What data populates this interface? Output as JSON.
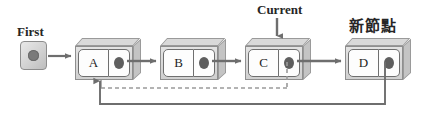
{
  "diagram": {
    "labels": {
      "first": "First",
      "current": "Current",
      "new_node": "新節點"
    },
    "head_pointer": {
      "name": "First",
      "dot": "pointer-dot"
    },
    "nodes": [
      {
        "id": "A",
        "value": "A",
        "pointer": "pointer-dot"
      },
      {
        "id": "B",
        "value": "B",
        "pointer": "pointer-dot"
      },
      {
        "id": "C",
        "value": "C",
        "pointer": "pointer-dot"
      },
      {
        "id": "D",
        "value": "D",
        "pointer": "pointer-dot"
      }
    ],
    "links": [
      {
        "from": "First",
        "to": "A",
        "style": "solid"
      },
      {
        "from": "A",
        "to": "B",
        "style": "solid"
      },
      {
        "from": "B",
        "to": "C",
        "style": "solid"
      },
      {
        "from": "C",
        "to": "D",
        "style": "solid"
      },
      {
        "from": "Current",
        "to": "C",
        "style": "solid"
      },
      {
        "from": "C",
        "to": "A",
        "style": "dashed"
      },
      {
        "from": "D",
        "to": "A",
        "style": "solid"
      }
    ],
    "colors": {
      "line": "#6e6e6e",
      "dashed_line": "#9a9a9a",
      "box_face": "#d9d9d9",
      "cell_fill": "#fdfdfd",
      "dot": "#5e5e5e",
      "text": "#262626",
      "background": "#ffffff"
    }
  }
}
